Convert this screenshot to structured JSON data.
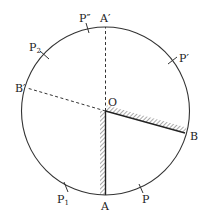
{
  "diagram": {
    "type": "geometry-circle-mirrors",
    "colors": {
      "stroke": "#333333",
      "background": "#ffffff"
    },
    "circle": {
      "cx": 105.5,
      "cy": 111,
      "r": 84
    },
    "center": {
      "label": "O"
    },
    "points": {
      "A": {
        "label": "A"
      },
      "A_prime": {
        "label": "A′"
      },
      "B": {
        "label": "B"
      },
      "B_prime": {
        "label": "B′"
      },
      "P": {
        "label": "P"
      },
      "P_prime": {
        "label": "P′"
      },
      "P_double_prime": {
        "label": "P″"
      },
      "P1": {
        "label": "P",
        "sub": "1"
      },
      "P2": {
        "label": "P",
        "sub": "2"
      }
    },
    "mirrors": [
      {
        "name": "mirror-OA",
        "from": "O",
        "to": "A",
        "hatched": true
      },
      {
        "name": "mirror-OB",
        "from": "O",
        "to": "B",
        "hatched": true
      }
    ],
    "dashed_lines": [
      {
        "name": "line-OA-prime",
        "from": "O",
        "to": "A′"
      },
      {
        "name": "line-OB-prime",
        "from": "O",
        "to": "B′"
      }
    ]
  }
}
